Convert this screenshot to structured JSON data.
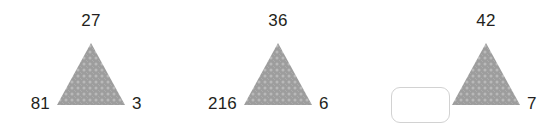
{
  "page": {
    "background_color": "#ffffff",
    "text_color": "#231f20"
  },
  "triangle_style": {
    "fill_color": "#9d9d9d",
    "pattern_dot_color": "#b9b9b9"
  },
  "answer_box": {
    "value": "",
    "placeholder": "",
    "border_color": "#d2d2d2"
  },
  "problems": [
    {
      "id": "problem-1",
      "top": "27",
      "left": "81",
      "right": "3",
      "left_is_input": false
    },
    {
      "id": "problem-2",
      "top": "36",
      "left": "216",
      "right": "6",
      "left_is_input": false
    },
    {
      "id": "problem-3",
      "top": "42",
      "left": "",
      "right": "7",
      "left_is_input": true
    }
  ]
}
